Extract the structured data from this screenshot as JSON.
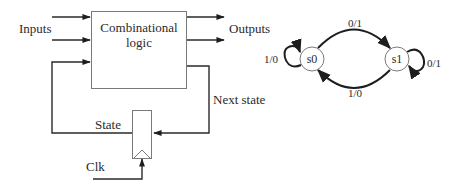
{
  "circuit": {
    "inputs_label": "Inputs",
    "outputs_label": "Outputs",
    "logic_block": {
      "line1": "Combinational",
      "line2": "logic"
    },
    "next_state_label": "Next state",
    "state_label": "State",
    "clock_label": "Clk"
  },
  "state_machine": {
    "states": [
      {
        "id": "s0",
        "label": "s0"
      },
      {
        "id": "s1",
        "label": "s1"
      }
    ],
    "transitions": [
      {
        "from": "s0",
        "to": "s0",
        "label": "1/0"
      },
      {
        "from": "s0",
        "to": "s1",
        "label": "0/1"
      },
      {
        "from": "s1",
        "to": "s1",
        "label": "0/1"
      },
      {
        "from": "s1",
        "to": "s0",
        "label": "1/0"
      }
    ]
  },
  "colors": {
    "line": "#2a2a2a",
    "box_border": "#7a7a7a",
    "background": "#ffffff"
  }
}
